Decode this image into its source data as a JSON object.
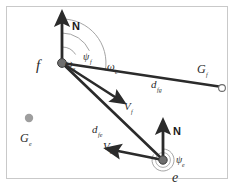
{
  "figure": {
    "kind": "vector-geometry-diagram",
    "canvas": {
      "width": 234,
      "height": 190,
      "background": "#ffffff"
    },
    "frame": {
      "stroke": "#c9c9c9",
      "visible": true
    }
  },
  "colors": {
    "line": "#2b2b2b",
    "arc": "#9a9a9a",
    "node_fill": "#808080",
    "node_stroke": "#4a4a4a",
    "ghost_node": "#9e9e9e",
    "text": "#2b2b2b",
    "frame": "#c9c9c9"
  },
  "nodes": [
    {
      "id": "node-f",
      "label": "f",
      "label_sub": "",
      "x": 62,
      "y": 63,
      "style": "filled-dot",
      "label_x": 36,
      "label_y": 70
    },
    {
      "id": "node-e",
      "label": "e",
      "label_sub": "",
      "x": 163,
      "y": 160,
      "style": "filled-dot-ringed",
      "label_x": 172,
      "label_y": 182
    },
    {
      "id": "node-gf",
      "label": "G",
      "label_sub": "f",
      "x": 222,
      "y": 88,
      "style": "open-circle",
      "label_x": 197,
      "label_y": 73
    },
    {
      "id": "node-ge",
      "label": "G",
      "label_sub": "e",
      "x": 29,
      "y": 118,
      "style": "ghost-dot",
      "label_x": 20,
      "label_y": 142
    }
  ],
  "north_arrows": [
    {
      "id": "north-arrow-f",
      "label": "N",
      "origin_x": 62,
      "origin_y": 63,
      "tip_x": 62,
      "tip_y": 14,
      "label_x": 72,
      "label_y": 28
    },
    {
      "id": "north-arrow-e",
      "label": "N",
      "origin_x": 163,
      "origin_y": 160,
      "tip_x": 163,
      "tip_y": 122,
      "label_x": 173,
      "label_y": 133
    }
  ],
  "vectors": [
    {
      "id": "velocity-f",
      "label": "V",
      "label_sub": "f",
      "from_x": 62,
      "from_y": 63,
      "to_x": 122,
      "to_y": 101,
      "label_x": 124,
      "label_y": 110
    },
    {
      "id": "velocity-e",
      "label": "V",
      "label_sub": "e",
      "from_x": 163,
      "from_y": 160,
      "to_x": 109,
      "to_y": 150,
      "label_x": 104,
      "label_y": 150
    }
  ],
  "range_lines": [
    {
      "id": "range-f-gf",
      "label": "d",
      "label_sub": "fg",
      "from_x": 62,
      "from_y": 63,
      "to_x": 220,
      "to_y": 87,
      "label_x": 151,
      "label_y": 88
    },
    {
      "id": "range-f-e",
      "label": "d",
      "label_sub": "fe",
      "from_x": 62,
      "from_y": 63,
      "to_x": 161,
      "to_y": 158,
      "label_x": 92,
      "label_y": 133
    }
  ],
  "angles": [
    {
      "id": "angle-omega-s",
      "label": "ω",
      "label_sub": "s",
      "center_x": 62,
      "center_y": 63,
      "radius": 16,
      "start_deg": 0,
      "end_deg": 58,
      "label_x": 66,
      "label_y": 66
    },
    {
      "id": "angle-psi-f",
      "label": "ψ",
      "label_sub": "f",
      "center_x": 62,
      "center_y": 63,
      "radius": 30,
      "start_deg": 0,
      "end_deg": 66,
      "label_x": 84,
      "label_y": 59
    },
    {
      "id": "angle-omega-e",
      "label": "ω",
      "label_sub": "e",
      "center_x": 62,
      "center_y": 63,
      "radius": 44,
      "start_deg": 0,
      "end_deg": 80,
      "label_x": 108,
      "label_y": 68
    },
    {
      "id": "angle-psi-e",
      "label": "ψ",
      "label_sub": "e",
      "center_x": 163,
      "center_y": 160,
      "radius": 11,
      "start_deg": 0,
      "end_deg": 300,
      "label_x": 176,
      "label_y": 162
    }
  ]
}
